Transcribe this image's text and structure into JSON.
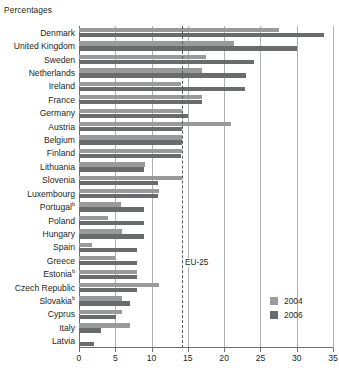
{
  "unit_title": "Percentages",
  "colors": {
    "y2004": "#9a9a9c",
    "y2006": "#6a6b6d",
    "gridline": "#aeb0b3",
    "axis": "#6d6e71",
    "reference_line": "#58595b",
    "text": "#231f20"
  },
  "legend": {
    "position": "bottom-right",
    "items": [
      {
        "label": "2004",
        "color": "#9a9a9c"
      },
      {
        "label": "2006",
        "color": "#6a6b6d"
      }
    ]
  },
  "reference": {
    "label": "EU-25",
    "value": 14.2
  },
  "footnote_marker": "b",
  "chart_data": {
    "type": "bar",
    "orientation": "horizontal",
    "title": "",
    "subtitle": "",
    "xlabel": "",
    "ylabel": "",
    "unit": "Percentages",
    "xlim": [
      0,
      35
    ],
    "xticks": [
      0,
      5,
      10,
      15,
      20,
      25,
      30,
      35
    ],
    "grid": true,
    "grid_axis": "x",
    "reference_line": {
      "label": "EU-25",
      "value": 14.2,
      "style": "dashed"
    },
    "categories": [
      "Denmark",
      "United Kingdom",
      "Sweden",
      "Netherlands",
      "Ireland",
      "France",
      "Germany",
      "Austria",
      "Belgium",
      "Finland",
      "Lithuania",
      "Slovenia",
      "Luxembourg",
      "Portugal",
      "Poland",
      "Hungary",
      "Spain",
      "Greece",
      "Estonia",
      "Czech Republic",
      "Slovakia",
      "Cyprus",
      "Italy",
      "Latvia"
    ],
    "category_footnotes": {
      "Portugal": "b",
      "Estonia": "b",
      "Slovakia": "b"
    },
    "series": [
      {
        "name": "2004",
        "color": "#9a9a9c",
        "values": [
          27.6,
          21.3,
          17.5,
          17.0,
          14.0,
          17.0,
          14.2,
          21.0,
          14.2,
          14.2,
          9.1,
          14.2,
          11.0,
          5.8,
          4.0,
          5.9,
          1.8,
          5.0,
          8.0,
          11.0,
          5.9,
          5.9,
          7.0,
          0.0
        ]
      },
      {
        "name": "2006",
        "color": "#6a6b6d",
        "values": [
          33.8,
          30.0,
          24.1,
          23.0,
          22.9,
          17.0,
          15.0,
          14.2,
          14.2,
          14.0,
          9.0,
          10.9,
          10.9,
          8.9,
          8.9,
          8.9,
          8.0,
          8.0,
          8.0,
          8.0,
          7.0,
          5.1,
          3.0,
          2.0
        ]
      }
    ]
  }
}
